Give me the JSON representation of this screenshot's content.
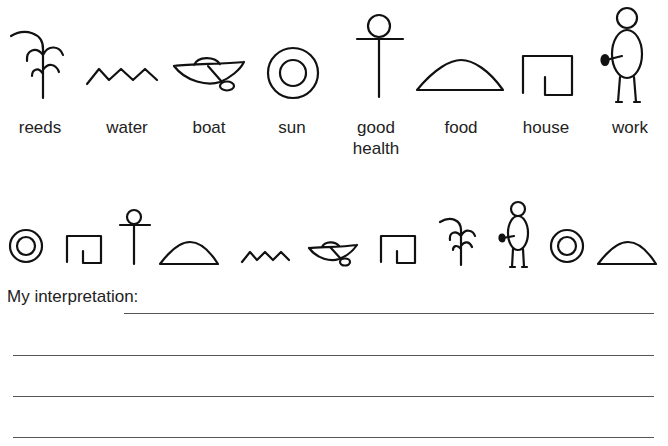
{
  "legend": {
    "symbols": [
      {
        "icon": "reeds-icon",
        "label": "reeds"
      },
      {
        "icon": "water-icon",
        "label": "water"
      },
      {
        "icon": "boat-icon",
        "label": "boat"
      },
      {
        "icon": "sun-icon",
        "label": "sun"
      },
      {
        "icon": "good-health-icon",
        "label": "good\nhealth",
        "label_line1": "good",
        "label_line2": "health"
      },
      {
        "icon": "food-icon",
        "label": "food"
      },
      {
        "icon": "house-icon",
        "label": "house"
      },
      {
        "icon": "work-icon",
        "label": "work"
      }
    ]
  },
  "message": {
    "sequence": [
      "sun",
      "house",
      "good health",
      "food",
      "water",
      "boat",
      "house",
      "reeds",
      "work",
      "sun",
      "food"
    ]
  },
  "answer": {
    "prompt": "My interpretation:",
    "blank_lines": 4,
    "value": ""
  },
  "colors": {
    "ink": "#111111",
    "line": "#555555",
    "background": "#ffffff"
  }
}
